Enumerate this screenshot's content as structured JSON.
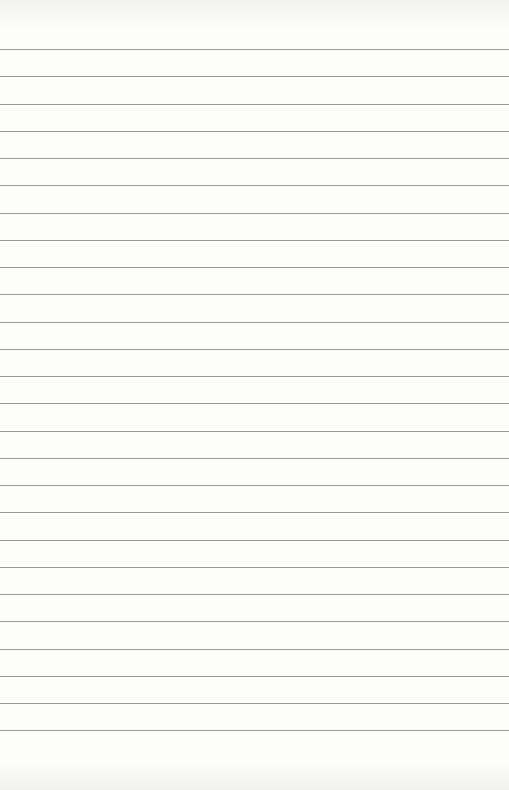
{
  "page": {
    "type": "lined-paper",
    "background_color": "#fdfdfc",
    "rule_color": "#9a9a9a",
    "rule_count": 26,
    "first_rule_y": 49,
    "rule_spacing": 27.25
  }
}
